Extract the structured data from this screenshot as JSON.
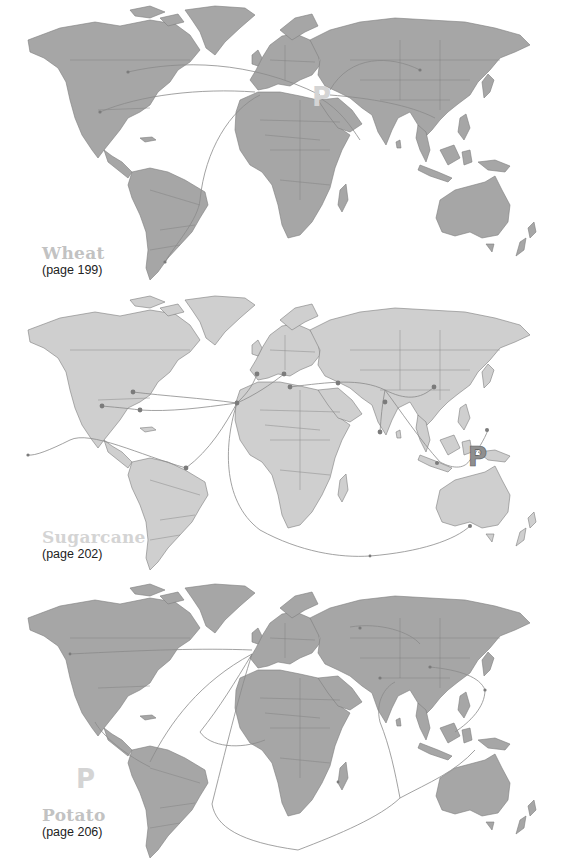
{
  "maps": [
    {
      "crop": "Wheat",
      "page_ref": "(page 199)",
      "origin_marker": "P",
      "land_color": "#a6a6a6",
      "marker_color": "#d4d4d4"
    },
    {
      "crop": "Sugarcane",
      "page_ref": "(page 202)",
      "origin_marker": "P",
      "land_color": "#cfcfcf",
      "marker_color": "#8f8f8f"
    },
    {
      "crop": "Potato",
      "page_ref": "(page 206)",
      "origin_marker": "P",
      "land_color": "#a6a6a6",
      "marker_color": "#d4d4d4"
    }
  ],
  "icons": {
    "origin": "origin-marker-p",
    "node": "route-node-dot"
  }
}
